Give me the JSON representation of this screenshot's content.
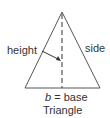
{
  "diagram": {
    "title": "Triangle",
    "labels": {
      "height": "height",
      "side": "side",
      "base_var": "b",
      "base_eq": "= base"
    },
    "colors": {
      "stroke": "#555555",
      "text": "#333333"
    }
  }
}
